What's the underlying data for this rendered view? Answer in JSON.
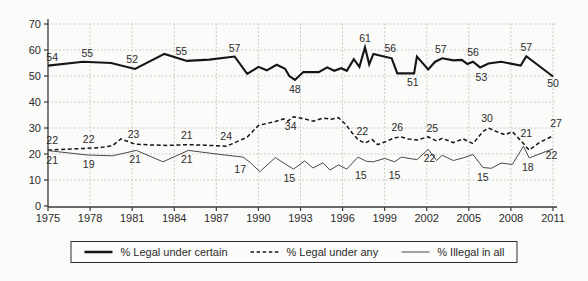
{
  "chart_data": {
    "type": "line",
    "title": "",
    "xlabel": "",
    "ylabel": "",
    "grid": true,
    "grid_color": "#c6c6c2",
    "axis_color": "#3a3a3a",
    "text_color": "#2b2b2b",
    "background_color": "#fbfbf9",
    "legend_position": "bottom",
    "x_axis": {
      "min": 1975,
      "max": 2011,
      "ticks": [
        1975,
        1978,
        1981,
        1984,
        1987,
        1990,
        1993,
        1996,
        1999,
        2002,
        2005,
        2008,
        2011
      ]
    },
    "y_axis": {
      "min": 0,
      "max": 70,
      "ticks": [
        0,
        10,
        20,
        30,
        40,
        50,
        60,
        70
      ]
    },
    "series": [
      {
        "name": "% Legal under certain",
        "style": "solid",
        "color": "#151515",
        "stroke_width": 2.1,
        "dash": "",
        "points": [
          [
            1975,
            54
          ],
          [
            1977.5,
            55.5
          ],
          [
            1979.5,
            55
          ],
          [
            1981.2,
            52.7
          ],
          [
            1983.3,
            58.5
          ],
          [
            1984.9,
            55.8
          ],
          [
            1986.5,
            56.3
          ],
          [
            1988.3,
            57.5
          ],
          [
            1989.2,
            50.8
          ],
          [
            1990,
            53.5
          ],
          [
            1990.6,
            52.2
          ],
          [
            1991.3,
            54.3
          ],
          [
            1991.9,
            52.8
          ],
          [
            1992.2,
            50
          ],
          [
            1992.6,
            48.5
          ],
          [
            1993.2,
            51.5
          ],
          [
            1994.3,
            51.5
          ],
          [
            1994.9,
            53.3
          ],
          [
            1995.4,
            52
          ],
          [
            1995.9,
            53
          ],
          [
            1996.3,
            52
          ],
          [
            1996.8,
            56.5
          ],
          [
            1997.2,
            53.5
          ],
          [
            1997.6,
            61
          ],
          [
            1997.9,
            54.5
          ],
          [
            1998.2,
            58.5
          ],
          [
            1999.5,
            56.8
          ],
          [
            1999.9,
            51
          ],
          [
            2001.1,
            51
          ],
          [
            2001.3,
            57.5
          ],
          [
            2002.1,
            52.5
          ],
          [
            2002.6,
            55.5
          ],
          [
            2003.1,
            56.8
          ],
          [
            2003.9,
            56
          ],
          [
            2004.5,
            56.2
          ],
          [
            2004.9,
            54.6
          ],
          [
            2005.3,
            55.5
          ],
          [
            2005.8,
            53.3
          ],
          [
            2006.4,
            54.8
          ],
          [
            2007.3,
            55.5
          ],
          [
            2008.7,
            54
          ],
          [
            2009.1,
            57.6
          ],
          [
            2011,
            49.8
          ]
        ],
        "labels": [
          {
            "t": "54",
            "x": 1975.3,
            "v": 54,
            "pos": "above"
          },
          {
            "t": "55",
            "x": 1977.8,
            "v": 55.5,
            "pos": "above"
          },
          {
            "t": "52",
            "x": 1981,
            "v": 53,
            "pos": "above"
          },
          {
            "t": "55",
            "x": 1984.5,
            "v": 56.3,
            "pos": "above"
          },
          {
            "t": "57",
            "x": 1988.3,
            "v": 57.5,
            "pos": "above"
          },
          {
            "t": "48",
            "x": 1992.6,
            "v": 48.5,
            "pos": "below"
          },
          {
            "t": "61",
            "x": 1997.6,
            "v": 61,
            "pos": "above"
          },
          {
            "t": "56",
            "x": 1999.4,
            "v": 57.5,
            "pos": "above"
          },
          {
            "t": "51",
            "x": 2001,
            "v": 51,
            "pos": "below"
          },
          {
            "t": "57",
            "x": 2003,
            "v": 57,
            "pos": "above"
          },
          {
            "t": "56",
            "x": 2005.3,
            "v": 55.8,
            "pos": "above"
          },
          {
            "t": "53",
            "x": 2005.9,
            "v": 53.2,
            "pos": "below"
          },
          {
            "t": "57",
            "x": 2009.1,
            "v": 57.6,
            "pos": "above"
          },
          {
            "t": "50",
            "x": 2011,
            "v": 49.8,
            "pos": "below",
            "dy": -3
          }
        ]
      },
      {
        "name": "% Legal under any",
        "style": "dashed",
        "color": "#151515",
        "stroke_width": 1.5,
        "dash": "4 2.6",
        "points": [
          [
            1975,
            21.5
          ],
          [
            1977,
            22
          ],
          [
            1978.6,
            22.4
          ],
          [
            1979.6,
            23.2
          ],
          [
            1980.2,
            25.8
          ],
          [
            1981.2,
            23.8
          ],
          [
            1982.2,
            23.5
          ],
          [
            1983.5,
            23.3
          ],
          [
            1985,
            23.6
          ],
          [
            1986.2,
            23.4
          ],
          [
            1987.7,
            23
          ],
          [
            1988.3,
            24.3
          ],
          [
            1989.2,
            26.5
          ],
          [
            1990,
            31
          ],
          [
            1991.2,
            32.5
          ],
          [
            1991.8,
            33.5
          ],
          [
            1992.1,
            32.7
          ],
          [
            1992.5,
            34.3
          ],
          [
            1993.2,
            33.6
          ],
          [
            1993.9,
            32.6
          ],
          [
            1994.6,
            33.8
          ],
          [
            1995.2,
            33.4
          ],
          [
            1995.7,
            34
          ],
          [
            1996.2,
            31.5
          ],
          [
            1996.7,
            28
          ],
          [
            1997.1,
            25.5
          ],
          [
            1997.6,
            24.2
          ],
          [
            1998.1,
            25.6
          ],
          [
            1998.5,
            23.6
          ],
          [
            1999,
            24.6
          ],
          [
            1999.6,
            26
          ],
          [
            2000.1,
            26.6
          ],
          [
            2000.7,
            25.8
          ],
          [
            2001.3,
            25.4
          ],
          [
            2002.1,
            26.6
          ],
          [
            2002.7,
            25
          ],
          [
            2003.1,
            26
          ],
          [
            2003.9,
            24.4
          ],
          [
            2004.6,
            25.8
          ],
          [
            2005.3,
            24
          ],
          [
            2006,
            28.6
          ],
          [
            2006.4,
            30
          ],
          [
            2007.1,
            28.3
          ],
          [
            2007.6,
            27.4
          ],
          [
            2008.1,
            28.6
          ],
          [
            2008.9,
            24
          ],
          [
            2009.3,
            21.5
          ],
          [
            2010,
            24.3
          ],
          [
            2011,
            27
          ]
        ],
        "labels": [
          {
            "t": "22",
            "x": 1975.3,
            "v": 22,
            "pos": "above"
          },
          {
            "t": "22",
            "x": 1977.9,
            "v": 22.4,
            "pos": "above"
          },
          {
            "t": "23",
            "x": 1981.1,
            "v": 24.2,
            "pos": "above"
          },
          {
            "t": "21",
            "x": 1984.9,
            "v": 24,
            "pos": "above"
          },
          {
            "t": "24",
            "x": 1987.7,
            "v": 23.6,
            "pos": "above"
          },
          {
            "t": "34",
            "x": 1992.3,
            "v": 34.3,
            "pos": "below"
          },
          {
            "t": "22",
            "x": 1997.4,
            "v": 25.2,
            "pos": "above"
          },
          {
            "t": "26",
            "x": 1999.9,
            "v": 26.8,
            "pos": "above"
          },
          {
            "t": "25",
            "x": 2002.4,
            "v": 26.5,
            "pos": "above"
          },
          {
            "t": "30",
            "x": 2006.3,
            "v": 30.2,
            "pos": "above"
          },
          {
            "t": "21",
            "x": 2009.1,
            "v": 24.6,
            "pos": "above"
          },
          {
            "t": "27",
            "x": 2011,
            "v": 27.5,
            "pos": "above",
            "dx": 3,
            "dy": -3
          }
        ]
      },
      {
        "name": "% Illegal in all",
        "style": "solid",
        "color": "#4a4a4a",
        "stroke_width": 1,
        "dash": "",
        "points": [
          [
            1975,
            21.3
          ],
          [
            1977.8,
            19.6
          ],
          [
            1979.6,
            19.3
          ],
          [
            1981.3,
            21.4
          ],
          [
            1983.2,
            17
          ],
          [
            1985,
            21.4
          ],
          [
            1987,
            20
          ],
          [
            1988.9,
            18.8
          ],
          [
            1989.4,
            16.8
          ],
          [
            1990.1,
            13.2
          ],
          [
            1991.2,
            18.6
          ],
          [
            1991.9,
            16.2
          ],
          [
            1992.5,
            14.2
          ],
          [
            1993.3,
            17.3
          ],
          [
            1993.9,
            14.6
          ],
          [
            1994.6,
            16.6
          ],
          [
            1995.1,
            13.8
          ],
          [
            1995.7,
            15.8
          ],
          [
            1996.3,
            14.2
          ],
          [
            1997.1,
            18.8
          ],
          [
            1997.7,
            17.2
          ],
          [
            1998.2,
            17
          ],
          [
            1999,
            18.3
          ],
          [
            1999.7,
            17
          ],
          [
            2000.2,
            18.8
          ],
          [
            2001.3,
            17.8
          ],
          [
            2002.1,
            21.8
          ],
          [
            2002.7,
            17.5
          ],
          [
            2003.1,
            19.5
          ],
          [
            2003.9,
            17.5
          ],
          [
            2004.6,
            18.5
          ],
          [
            2005.3,
            19.8
          ],
          [
            2006,
            14.8
          ],
          [
            2006.6,
            14.5
          ],
          [
            2007.3,
            16.5
          ],
          [
            2008.1,
            16
          ],
          [
            2008.9,
            23
          ],
          [
            2009.3,
            18.5
          ],
          [
            2011,
            22
          ]
        ],
        "labels": [
          {
            "t": "21",
            "x": 1975.3,
            "v": 21.3,
            "pos": "below"
          },
          {
            "t": "19",
            "x": 1977.9,
            "v": 19.6,
            "pos": "below"
          },
          {
            "t": "21",
            "x": 1981.2,
            "v": 21.4,
            "pos": "below"
          },
          {
            "t": "21",
            "x": 1984.9,
            "v": 21.4,
            "pos": "below"
          },
          {
            "t": "17",
            "x": 1988.7,
            "v": 17.8,
            "pos": "below"
          },
          {
            "t": "15",
            "x": 1992.2,
            "v": 14.2,
            "pos": "below"
          },
          {
            "t": "15",
            "x": 1997.3,
            "v": 15.5,
            "pos": "below"
          },
          {
            "t": "15",
            "x": 1999.7,
            "v": 15.5,
            "pos": "below"
          },
          {
            "t": "22",
            "x": 2002.2,
            "v": 21.8,
            "pos": "below"
          },
          {
            "t": "15",
            "x": 2006,
            "v": 14.8,
            "pos": "below"
          },
          {
            "t": "18",
            "x": 2009.2,
            "v": 18.3,
            "pos": "below"
          },
          {
            "t": "22",
            "x": 2010.9,
            "v": 22,
            "pos": "below",
            "dy": -3
          }
        ]
      }
    ]
  }
}
